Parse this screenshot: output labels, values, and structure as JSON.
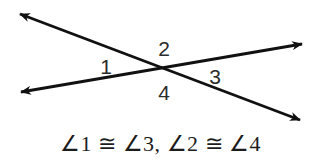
{
  "figure": {
    "background_color": "#ffffff",
    "line_color": "#111111",
    "label_color": "#2b2b2b",
    "caption_color": "#1c1c1c",
    "width": 321,
    "height": 167,
    "intersection": {
      "x": 163,
      "y": 70
    },
    "lines": [
      {
        "name": "line-descending",
        "from": {
          "x": 20,
          "y": 14
        },
        "to": {
          "x": 300,
          "y": 120
        },
        "arrow_start": true,
        "arrow_end": true
      },
      {
        "name": "line-ascending",
        "from": {
          "x": 21,
          "y": 92
        },
        "to": {
          "x": 302,
          "y": 44
        },
        "arrow_start": true,
        "arrow_end": true
      }
    ],
    "angle_labels": [
      {
        "id": "1",
        "text": "1",
        "x": 106,
        "y": 66
      },
      {
        "id": "2",
        "text": "2",
        "x": 164,
        "y": 48
      },
      {
        "id": "3",
        "text": "3",
        "x": 215,
        "y": 76
      },
      {
        "id": "4",
        "text": "4",
        "x": 164,
        "y": 92
      }
    ],
    "caption": "∠1 ≅ ∠3, ∠2 ≅ ∠4"
  }
}
